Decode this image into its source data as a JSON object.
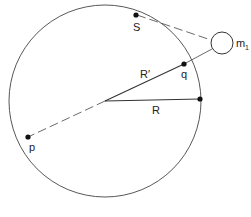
{
  "diagram": {
    "labels": {
      "S": "S",
      "m": "m",
      "m_sub": "1",
      "q": "q",
      "R_prime": "R′",
      "R": "R",
      "p": "p"
    },
    "colors": {
      "stroke": "#333333",
      "background": "#ffffff"
    },
    "geometry": {
      "circle_center": [
        105,
        101
      ],
      "circle_radius": 96,
      "body_m1_center": [
        222,
        43
      ],
      "body_m1_radius": 11
    }
  }
}
